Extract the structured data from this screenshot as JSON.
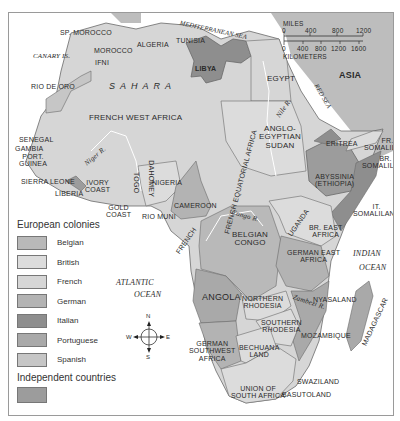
{
  "map": {
    "title_implied": "Africa colonial map",
    "colors": {
      "ocean": "#ffffff",
      "belgian": "#b9b9b9",
      "british": "#dcdcdc",
      "french": "#d6d6d6",
      "german": "#b3b3b3",
      "italian": "#8e8e8e",
      "portuguese": "#a9a9a9",
      "spanish": "#c6c6c6",
      "independent": "#9c9c9c",
      "asia": "#bdbdbd",
      "border": "#6a6a6a"
    },
    "labels": {
      "sp_morocco": "SP. MOROCCO",
      "mediterranean": "MEDITERRANEAN SEA",
      "algeria": "ALGERIA",
      "tunisia": "TUNISIA",
      "morocco": "MOROCCO",
      "canary": "CANARY IS.",
      "ifni": "IFNI",
      "libya": "LIBYA",
      "egypt": "EGYPT",
      "asia": "ASIA",
      "sahara": "SAHARA",
      "rio_de_oro": "RIO DE ORO",
      "fwa": "FRENCH WEST AFRICA",
      "nile": "Nile R.",
      "red_sea": "RED SEA",
      "anglo": "ANGLO-\nEGYPTIAN\nSUDAN",
      "eritrea": "ERITREA",
      "fr_somaliland": "FR.\nSOMALILAND",
      "br_somaliland": "BR.\nSOMALILAND",
      "abyssinia": "ABYSSINIA\n(ETHIOPIA)",
      "it_somaliland": "IT.\nSOMALILAND",
      "senegal": "SENEGAL",
      "gambia": "GAMBIA",
      "port_guinea": "PORT.\nGUINEA",
      "niger": "Niger R.",
      "sierra_leone": "SIERRA LEONE",
      "liberia": "LIBERIA",
      "ivory": "IVORY\nCOAST",
      "gold": "GOLD\nCOAST",
      "togo": "TOGO",
      "dahomey": "DAHOMEY",
      "nigeria": "NIGERIA",
      "cameroon": "CAMEROON",
      "rio_muni": "RIO MUNI",
      "fea": "FRENCH EQUATORIAL AFRICA",
      "french": "FRENCH",
      "congo_r": "Congo R.",
      "belgian_congo": "BELGIAN\nCONGO",
      "uganda": "UGANDA",
      "br_east": "BR. EAST\nAFRICA",
      "gea": "GERMAN EAST\nAFRICA",
      "indian": "INDIAN",
      "ocean_indian": "OCEAN",
      "atlantic": "ATLANTIC",
      "ocean_atlantic": "OCEAN",
      "angola": "ANGOLA",
      "n_rhodesia": "NORTHERN\nRHODESIA",
      "zambezi": "Zambezi R.",
      "nyasaland": "NYASALAND",
      "s_rhodesia": "SOUTHERN\nRHODESIA",
      "mozambique": "MOZAMBIQUE",
      "madagascar": "MADAGASCAR",
      "gswa": "GERMAN\nSOUTHWEST\nAFRICA",
      "bechuana": "BECHUANA\nLAND",
      "swaziland": "SWAZILAND",
      "union": "UNION OF\nSOUTH AFRICA",
      "basutoland": "BASUTOLAND"
    },
    "scale": {
      "miles_label": "MILES",
      "miles_ticks": [
        "0",
        "400",
        "800",
        "1200"
      ],
      "km_ticks": [
        "0",
        "400",
        "800",
        "1200",
        "1600"
      ],
      "km_label": "KILOMETERS"
    },
    "compass": {
      "n": "N",
      "s": "S",
      "e": "E",
      "w": "W"
    }
  },
  "legend": {
    "colonies_title": "European colonies",
    "items": [
      {
        "label": "Belgian",
        "color": "#b9b9b9"
      },
      {
        "label": "British",
        "color": "#dcdcdc"
      },
      {
        "label": "French",
        "color": "#d6d6d6"
      },
      {
        "label": "German",
        "color": "#b3b3b3"
      },
      {
        "label": "Italian",
        "color": "#8e8e8e"
      },
      {
        "label": "Portuguese",
        "color": "#a9a9a9"
      },
      {
        "label": "Spanish",
        "color": "#c6c6c6"
      }
    ],
    "independent_title": "Independent countries",
    "independent_color": "#9c9c9c"
  }
}
